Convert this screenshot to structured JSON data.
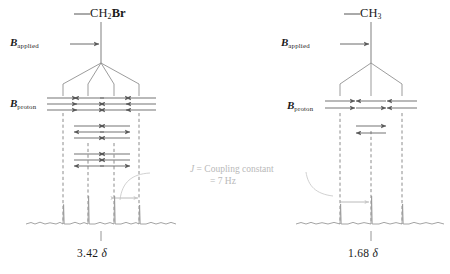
{
  "figure": {
    "title_hidden": "NMR spin-spin splitting tree diagram",
    "colors": {
      "line": "#808080",
      "arrow": "#5a5a5a",
      "dash": "#6e6e6e",
      "spectrum": "#9a9a9a",
      "text": "#1a1a1a",
      "annotation": "#bdbdbd",
      "background": "#ffffff"
    }
  },
  "panels": [
    {
      "id": "left",
      "formula_prefix": "—",
      "formula_base": "CH",
      "formula_sub": "2",
      "formula_suffix": "Br",
      "applied_label_b": "B",
      "applied_label_sub": "applied",
      "proton_label_b": "B",
      "proton_label_sub": "proton",
      "multiplicity": "quartet",
      "branches": 4,
      "shift_value": "3.42",
      "shift_unit": "δ",
      "spin_columns": [
        {
          "index": 1,
          "groups": [
            [
              "right",
              "right",
              "right"
            ]
          ]
        },
        {
          "index": 2,
          "groups": [
            [
              "left",
              "right",
              "right"
            ],
            [
              "right",
              "left",
              "right"
            ],
            [
              "right",
              "right",
              "left"
            ]
          ]
        },
        {
          "index": 3,
          "groups": [
            [
              "right",
              "left",
              "left"
            ],
            [
              "left",
              "right",
              "left"
            ],
            [
              "left",
              "left",
              "right"
            ]
          ]
        },
        {
          "index": 4,
          "groups": [
            [
              "left",
              "left",
              "left"
            ]
          ]
        }
      ],
      "peak_intensities": [
        1,
        3,
        3,
        1
      ]
    },
    {
      "id": "right",
      "formula_prefix": "—",
      "formula_base": "CH",
      "formula_sub": "3",
      "formula_suffix": "",
      "applied_label_b": "B",
      "applied_label_sub": "applied",
      "proton_label_b": "B",
      "proton_label_sub": "proton",
      "multiplicity": "triplet",
      "branches": 3,
      "shift_value": "1.68",
      "shift_unit": "δ",
      "spin_columns": [
        {
          "index": 1,
          "groups": [
            [
              "right",
              "right"
            ]
          ]
        },
        {
          "index": 2,
          "groups": [
            [
              "left",
              "right"
            ],
            [
              "right",
              "left"
            ]
          ]
        },
        {
          "index": 3,
          "groups": [
            [
              "left",
              "left"
            ]
          ]
        }
      ],
      "peak_intensities": [
        1,
        2,
        1
      ]
    }
  ],
  "annotation": {
    "line1_italic": "J",
    "line1_rest": " = Coupling constant",
    "line2": "= 7 Hz"
  }
}
